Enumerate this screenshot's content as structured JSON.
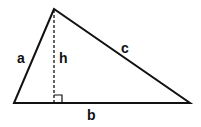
{
  "diagram": {
    "type": "triangle-with-altitude",
    "colors": {
      "stroke": "#111111",
      "background": "#ffffff"
    },
    "vertices": {
      "apex": [
        54,
        9
      ],
      "base_left": [
        14,
        103
      ],
      "base_right": [
        190,
        103
      ]
    },
    "labels": {
      "side_a": "a",
      "side_b": "b",
      "side_c": "c",
      "height": "h"
    },
    "right_angle_marker": true
  }
}
